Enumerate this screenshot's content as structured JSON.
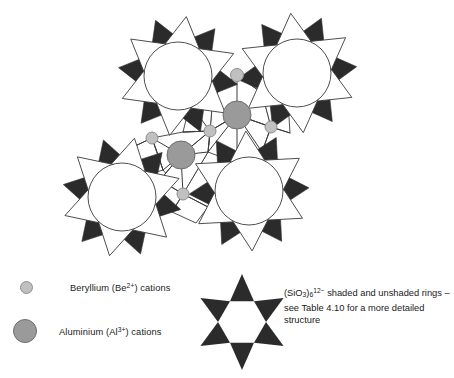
{
  "figure": {
    "description": "Schematic of the beryl (Be3Al2Si6O18) structure showing four linked six-membered silicate rings drawn as twelve-pointed stars, joined by beryllium and aluminium cations."
  },
  "colors": {
    "shaded_ring_fill": "#2b2b2b",
    "unshaded_ring_fill": "#ffffff",
    "outline": "#3a3a3a",
    "beryllium_fill": "#c0c0c0",
    "beryllium_stroke": "#8e8e8e",
    "aluminium_fill": "#9a9a9a",
    "aluminium_stroke": "#6f6f6f",
    "background": "#ffffff",
    "text": "#1a1a1a"
  },
  "legend": {
    "items": [
      {
        "key": "beryllium",
        "swatch": "small-gray-circle",
        "label_prefix": "Beryllium (Be",
        "label_charge": "2+",
        "label_suffix": ") cations",
        "label_plain": "Beryllium (Be2+) cations"
      },
      {
        "key": "aluminium",
        "swatch": "large-gray-circle",
        "label_prefix": "Aluminium (Al",
        "label_charge": "3+",
        "label_suffix": ") cations",
        "label_plain": "Aluminium (Al3+) cations"
      }
    ],
    "ring_symbol": {
      "name": "hexagram-star-of-david",
      "formula_prefix": "(SiO",
      "formula_sub1": "3",
      "formula_mid": ")",
      "formula_sub2": "6",
      "formula_charge": "12−",
      "text_line1_rest": " shaded and unshaded",
      "text_line2": "rings – see Table 4.10 for a more",
      "text_line3": "detailed structure",
      "plain": "(SiO3)6 12− shaded and unshaded rings – see Table 4.10 for a more detailed structure"
    }
  },
  "diagram": {
    "rings": [
      {
        "id": "ring-top-left",
        "cx": 178,
        "cy": 76,
        "outer_r": 60,
        "inner_r": 34,
        "rotation": 8
      },
      {
        "id": "ring-top-right",
        "cx": 297,
        "cy": 73,
        "outer_r": 60,
        "inner_r": 34,
        "rotation": -6
      },
      {
        "id": "ring-bottom-left",
        "cx": 122,
        "cy": 197,
        "outer_r": 60,
        "inner_r": 34,
        "rotation": 12
      },
      {
        "id": "ring-bottom-right",
        "cx": 249,
        "cy": 191,
        "outer_r": 60,
        "inner_r": 34,
        "rotation": -3
      }
    ],
    "cations": [
      {
        "id": "be-1",
        "type": "beryllium",
        "cx": 237,
        "cy": 75,
        "r": 6.5
      },
      {
        "id": "be-2",
        "type": "beryllium",
        "cx": 210,
        "cy": 131,
        "r": 6.0
      },
      {
        "id": "be-3",
        "type": "beryllium",
        "cx": 271,
        "cy": 127,
        "r": 6.0
      },
      {
        "id": "be-4",
        "type": "beryllium",
        "cx": 152,
        "cy": 138,
        "r": 6.0
      },
      {
        "id": "be-5",
        "type": "beryllium",
        "cx": 183,
        "cy": 194,
        "r": 6.0
      },
      {
        "id": "al-1",
        "type": "aluminium",
        "cx": 237,
        "cy": 115,
        "r": 14.0
      },
      {
        "id": "al-2",
        "type": "aluminium",
        "cx": 181,
        "cy": 155,
        "r": 14.0
      }
    ],
    "bond_count": 22,
    "ring_count": 4
  }
}
